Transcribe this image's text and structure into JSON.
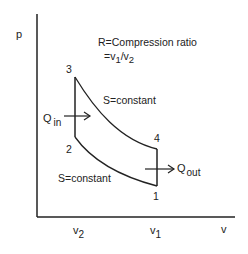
{
  "diagram": {
    "type": "pv-diagram",
    "axes": {
      "y_label": "p",
      "x_label": "v",
      "x_ticks": [
        {
          "label": "v",
          "sub": "2"
        },
        {
          "label": "v",
          "sub": "1"
        }
      ]
    },
    "annotation": {
      "line1": "R=Compression ratio",
      "line2_prefix": "=v",
      "line2_sub1": "1",
      "line2_mid": "/v",
      "line2_sub2": "2"
    },
    "points": [
      {
        "id": "1",
        "label": "1"
      },
      {
        "id": "2",
        "label": "2"
      },
      {
        "id": "3",
        "label": "3"
      },
      {
        "id": "4",
        "label": "4"
      }
    ],
    "process_labels": {
      "expansion": "S=constant",
      "compression": "S=constant"
    },
    "heat": {
      "in_label": "Q",
      "in_sub": "in",
      "out_label": "Q",
      "out_sub": "out"
    }
  }
}
